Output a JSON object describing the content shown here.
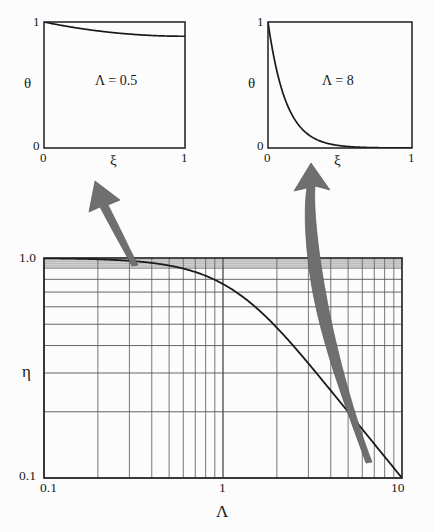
{
  "figure": {
    "kind": "fin-efficiency-log-log-chart-with-two-temperature-profile-insets",
    "background_color": "#fcfcfc",
    "ink_color": "#1a1a1a",
    "arrow_color": "#6b6b6b"
  },
  "insets": {
    "left": {
      "annotation": "Λ = 0.5",
      "ylabel": "θ",
      "xlabel": "ξ",
      "y_ticks": [
        "0",
        "1"
      ],
      "x_ticks": [
        "0",
        "1"
      ]
    },
    "right": {
      "annotation": "Λ = 8",
      "ylabel": "θ",
      "xlabel": "ξ",
      "y_ticks": [
        "0",
        "1"
      ],
      "x_ticks": [
        "0",
        "1"
      ]
    }
  },
  "main": {
    "ylabel": "η",
    "xlabel": "Λ",
    "y_ticks": [
      "1.0",
      "0.1"
    ],
    "x_ticks": [
      "0.1",
      "1",
      "10"
    ]
  },
  "chart_data": [
    {
      "type": "line",
      "id": "inset-left-temperature-profile",
      "title": "Λ = 0.5",
      "xlabel": "ξ",
      "ylabel": "θ",
      "xlim": [
        0,
        1
      ],
      "ylim": [
        0,
        1
      ],
      "grid": false,
      "xticks": [
        0,
        1
      ],
      "xticklabels": [
        "0",
        "1"
      ],
      "yticks": [
        0,
        1
      ],
      "yticklabels": [
        "0",
        "1"
      ],
      "annotations": [
        {
          "text": "Λ = 0.5",
          "x": 0.48,
          "y": 0.52
        }
      ],
      "series": [
        {
          "name": "theta(xi) for Lambda = 0.5",
          "formula": "cosh(Lambda*(1-xi))/cosh(Lambda)",
          "x": [
            0.0,
            0.05,
            0.1,
            0.15,
            0.2,
            0.25,
            0.3,
            0.35,
            0.4,
            0.45,
            0.5,
            0.55,
            0.6,
            0.65,
            0.7,
            0.75,
            0.8,
            0.85,
            0.9,
            0.95,
            1.0
          ],
          "y": [
            1.0,
            0.99,
            0.981,
            0.973,
            0.966,
            0.96,
            0.954,
            0.949,
            0.945,
            0.941,
            0.938,
            0.935,
            0.933,
            0.931,
            0.93,
            0.929,
            0.928,
            0.9275,
            0.9272,
            0.9271,
            0.9271
          ]
        }
      ]
    },
    {
      "type": "line",
      "id": "inset-right-temperature-profile",
      "title": "Λ = 8",
      "xlabel": "ξ",
      "ylabel": "θ",
      "xlim": [
        0,
        1
      ],
      "ylim": [
        0,
        1
      ],
      "grid": false,
      "xticks": [
        0,
        1
      ],
      "xticklabels": [
        "0",
        "1"
      ],
      "yticks": [
        0,
        1
      ],
      "yticklabels": [
        "0",
        "1"
      ],
      "annotations": [
        {
          "text": "Λ = 8",
          "x": 0.5,
          "y": 0.52
        }
      ],
      "series": [
        {
          "name": "theta(xi) for Lambda = 8",
          "formula": "cosh(Lambda*(1-xi))/cosh(Lambda)",
          "x": [
            0.0,
            0.05,
            0.1,
            0.15,
            0.2,
            0.25,
            0.3,
            0.35,
            0.4,
            0.45,
            0.5,
            0.6,
            0.7,
            0.8,
            0.9,
            1.0
          ],
          "y": [
            1.0,
            0.671,
            0.45,
            0.302,
            0.203,
            0.137,
            0.0925,
            0.0632,
            0.0437,
            0.0309,
            0.0225,
            0.0133,
            0.00977,
            0.00862,
            0.00822,
            0.000671
          ]
        }
      ]
    },
    {
      "type": "line",
      "id": "main-fin-efficiency-curve",
      "title": "",
      "xlabel": "Λ",
      "ylabel": "η",
      "xscale": "log",
      "yscale": "log",
      "xlim": [
        0.1,
        10
      ],
      "ylim": [
        0.1,
        1.0
      ],
      "grid": true,
      "grid_style": "log-minor-and-major",
      "xticks": [
        0.1,
        1,
        10
      ],
      "xticklabels": [
        "0.1",
        "1",
        "10"
      ],
      "yticks": [
        0.1,
        1.0
      ],
      "yticklabels": [
        "0.1",
        "1.0"
      ],
      "series": [
        {
          "name": "eta = tanh(Lambda)/Lambda",
          "formula": "tanh(Lambda)/Lambda",
          "x": [
            0.1,
            0.15,
            0.2,
            0.3,
            0.4,
            0.5,
            0.6,
            0.7,
            0.8,
            0.9,
            1.0,
            1.2,
            1.5,
            2.0,
            2.5,
            3.0,
            4.0,
            5.0,
            6.0,
            7.0,
            8.0,
            9.0,
            10.0
          ],
          "y": [
            0.99668,
            0.99256,
            0.98685,
            0.97045,
            0.9483,
            0.92423,
            0.89542,
            0.86626,
            0.8353,
            0.8041,
            0.76159,
            0.69477,
            0.60507,
            0.48201,
            0.3959,
            0.332,
            0.24938,
            0.19999,
            0.16667,
            0.14286,
            0.125,
            0.11111,
            0.1
          ]
        }
      ]
    }
  ],
  "arrows": [
    {
      "name": "arrow-to-left-inset",
      "from_label": "Λ ≈ 0.5 on main curve",
      "to_label": "left inset"
    },
    {
      "name": "arrow-to-right-inset",
      "from_label": "Λ ≈ 8 on main curve",
      "to_label": "right inset"
    }
  ]
}
